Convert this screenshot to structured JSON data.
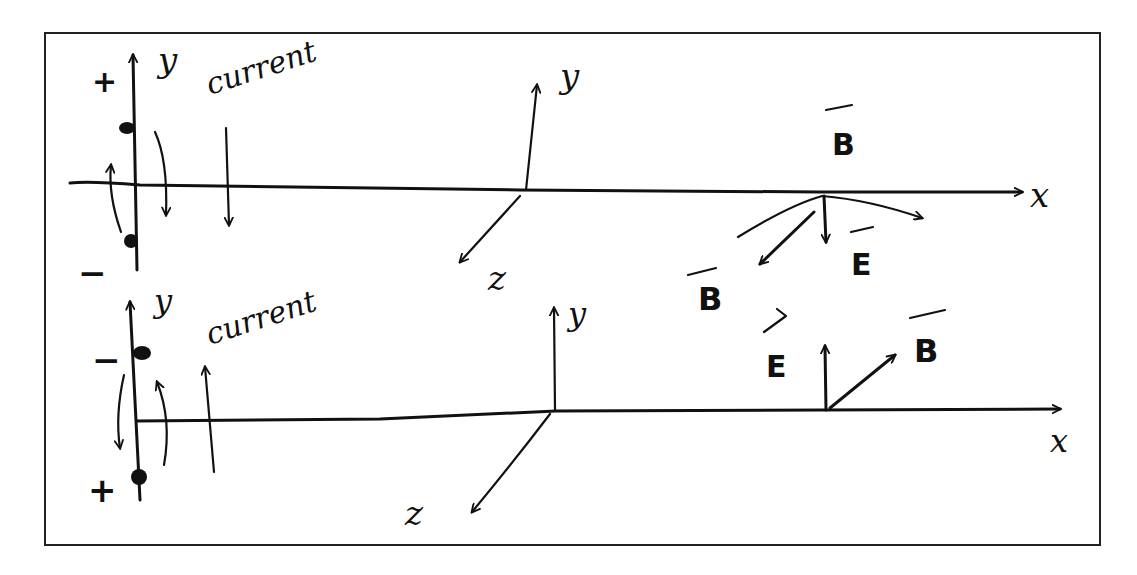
{
  "diagram": {
    "ink_color": "#111111",
    "background": "#ffffff",
    "top_panel": {
      "dipole": {
        "top_charge": "+",
        "bottom_charge": "−",
        "axis_label": "y",
        "current_label": "current",
        "current_direction": "down"
      },
      "axes_origin": {
        "y_label": "y",
        "z_label": "z"
      },
      "x_axis_label": "x",
      "field_point": {
        "b_label_top": "B",
        "b_label_left": "B",
        "e_label": "E"
      }
    },
    "bottom_panel": {
      "dipole": {
        "top_charge": "−",
        "bottom_charge": "+",
        "axis_label": "y",
        "current_label": "current",
        "current_direction": "up"
      },
      "axes_origin": {
        "y_label": "y",
        "z_label": "z"
      },
      "x_axis_label": "x",
      "field_point": {
        "e_label": "E",
        "b_label": "B"
      }
    }
  }
}
